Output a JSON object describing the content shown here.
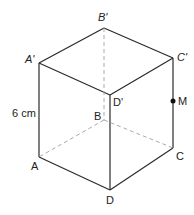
{
  "diagram": {
    "type": "cube",
    "vertices": {
      "A'": {
        "label": "A'",
        "x": 39,
        "y": 63
      },
      "B'": {
        "label": "B'",
        "x": 104,
        "y": 28
      },
      "C'": {
        "label": "C'",
        "x": 173,
        "y": 58
      },
      "D'": {
        "label": "D'",
        "x": 110,
        "y": 95
      },
      "A": {
        "label": "A",
        "x": 39,
        "y": 157
      },
      "B": {
        "label": "B",
        "x": 104,
        "y": 120
      },
      "C": {
        "label": "C",
        "x": 173,
        "y": 148
      },
      "D": {
        "label": "D",
        "x": 110,
        "y": 190
      }
    },
    "point_m": {
      "label": "M",
      "x": 173,
      "y": 101
    },
    "dimension": {
      "label": "6 cm",
      "edge": "AA'"
    },
    "labels": {
      "a_prime": "A'",
      "b_prime": "B'",
      "c_prime": "C'",
      "d_prime": "D'",
      "a": "A",
      "b": "B",
      "c": "C",
      "d": "D",
      "m": "M",
      "dimension": "6 cm"
    },
    "colors": {
      "line": "#2a2a2a",
      "hidden": "#aaaaaa"
    }
  }
}
